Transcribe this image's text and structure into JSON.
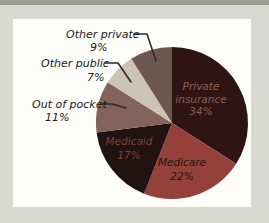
{
  "chart_data": {
    "type": "pie",
    "title": "",
    "categories": [
      "Private insurance",
      "Medicare",
      "Medicaid",
      "Out of pocket",
      "Other public",
      "Other private"
    ],
    "values": [
      34,
      22,
      17,
      11,
      7,
      9
    ],
    "unit": "%",
    "direction": "clockwise",
    "start_angle": "12-o-clock",
    "colors": [
      "#2e1412",
      "#954039",
      "#201311",
      "#84635b",
      "#ccc3b3",
      "#6e5751"
    ],
    "labels_inside": [
      "Private insurance 34%",
      "Medicare 22%",
      "Medicaid 17%"
    ],
    "labels_outside": [
      "Out of pocket 11%",
      "Other public 7%",
      "Other private 9%"
    ],
    "legend": "none"
  },
  "labels": {
    "private_insurance": {
      "name_line1": "Private",
      "name_line2": "insurance",
      "pct": "34%"
    },
    "medicare": {
      "name": "Medicare",
      "pct": "22%"
    },
    "medicaid": {
      "name": "Medicaid",
      "pct": "17%"
    },
    "out_of_pocket": {
      "name": "Out of pocket",
      "pct": "11%"
    },
    "other_public": {
      "name": "Other public",
      "pct": "7%"
    },
    "other_private": {
      "name": "Other private",
      "pct": "9%"
    }
  },
  "colors": {
    "background": "#d7d9d2",
    "top_bar": "#9c9d98",
    "panel": "#fdfdfa",
    "leader_line": "#2d2a25",
    "outside_label_text": "#21201c",
    "text_private_insurance": "#8a5f55",
    "text_medicare": "#2b1713",
    "text_medicaid": "#7e4037"
  }
}
